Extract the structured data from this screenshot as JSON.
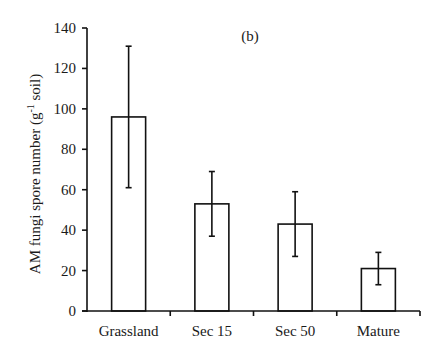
{
  "chart_data": {
    "type": "bar",
    "title": "(b)",
    "xlabel": "",
    "ylabel": "AM fungi spore number (g",
    "ylabel_superscript": "-1",
    "ylabel_suffix": " soil)",
    "categories": [
      "Grassland",
      "Sec 15",
      "Sec 50",
      "Mature"
    ],
    "values": [
      96,
      53,
      43,
      21
    ],
    "error_upper": [
      131,
      69,
      59,
      29
    ],
    "error_lower": [
      61,
      37,
      27,
      13
    ],
    "ylim": [
      0,
      140
    ],
    "yticks": [
      0,
      20,
      40,
      60,
      80,
      100,
      120,
      140
    ],
    "grid": false,
    "legend": null,
    "bar_fill": "#ffffff",
    "bar_stroke": "#111111"
  }
}
